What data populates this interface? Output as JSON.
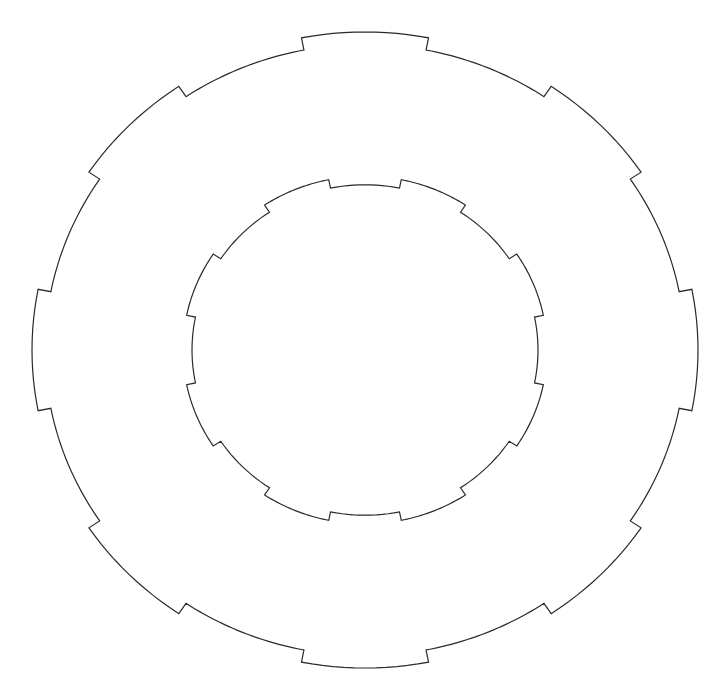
{
  "figure": {
    "title": "",
    "stroke_color": "#2a2a2a",
    "background_color": "#ffffff",
    "outer_ring": {
      "tab_count": 8,
      "tab_direction": "outward",
      "tab_angles_deg": [
        0,
        45,
        90,
        135,
        180,
        225,
        270,
        315
      ],
      "tab_half_span_deg": 11
    },
    "inner_ring": {
      "notch_count": 8,
      "notch_direction": "inward",
      "notch_angles_deg": [
        0,
        45,
        90,
        135,
        180,
        225,
        270,
        315
      ],
      "notch_half_span_deg": 11.5
    }
  }
}
